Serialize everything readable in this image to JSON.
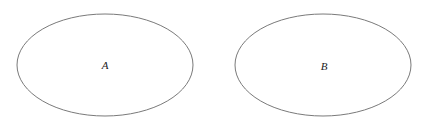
{
  "diagram": {
    "type": "sets",
    "stroke_color": "#7a7a7a",
    "background": "#ffffff",
    "sets": [
      {
        "label": "A",
        "cx": 105,
        "cy": 65,
        "rx": 88,
        "ry": 51
      },
      {
        "label": "B",
        "cx": 323,
        "cy": 65,
        "rx": 88,
        "ry": 51
      }
    ]
  }
}
